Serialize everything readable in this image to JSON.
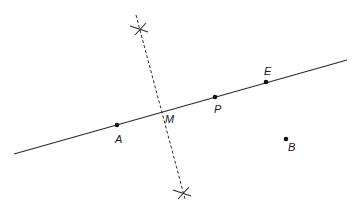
{
  "diagram": {
    "type": "geometric-construction",
    "colors": {
      "stroke": "#2a2a2a",
      "background": "#ffffff"
    },
    "line": {
      "x1": 14,
      "y1": 154,
      "x2": 347,
      "y2": 60
    },
    "bisector": {
      "x1": 136,
      "y1": 15,
      "x2": 185,
      "y2": 199,
      "style": "dashed"
    },
    "arc_marks": [
      {
        "name": "top",
        "cx": 140,
        "cy": 29
      },
      {
        "name": "bottom",
        "cx": 183,
        "cy": 193
      }
    ],
    "points": [
      {
        "id": "A",
        "label": "A",
        "x": 117,
        "y": 125,
        "lx": 115,
        "ly": 143
      },
      {
        "id": "M",
        "label": "M",
        "x": 162,
        "y": 112,
        "lx": 165,
        "ly": 123,
        "dot": false
      },
      {
        "id": "P",
        "label": "P",
        "x": 215,
        "y": 97,
        "lx": 214,
        "ly": 113
      },
      {
        "id": "E",
        "label": "E",
        "x": 266,
        "y": 82,
        "lx": 264,
        "ly": 75
      },
      {
        "id": "B",
        "label": "B",
        "x": 286,
        "y": 139,
        "lx": 288,
        "ly": 151
      }
    ]
  }
}
